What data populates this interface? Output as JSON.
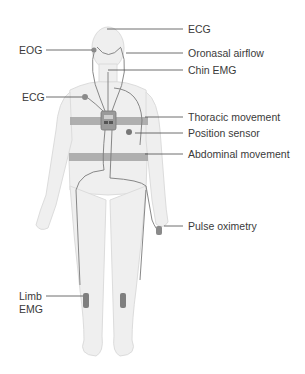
{
  "diagram": {
    "labels": {
      "ecg_head": "ECG",
      "eog": "EOG",
      "oronasal": "Oronasal airflow",
      "chin_emg": "Chin EMG",
      "ecg_chest": "ECG",
      "thoracic": "Thoracic movement",
      "position": "Position sensor",
      "abdominal": "Abdominal movement",
      "pulse": "Pulse oximetry",
      "limb_line1": "Limb",
      "limb_line2": "EMG"
    },
    "colors": {
      "skin": "#efefef",
      "outline": "#dcdcdc",
      "belt": "#a3a3a3",
      "wire": "#7a7a7a",
      "sensor": "#8a8a8a",
      "leader": "#4a4a4a",
      "text": "#3a3a3a"
    }
  }
}
